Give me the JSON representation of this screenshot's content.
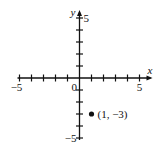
{
  "chart_data": {
    "type": "scatter",
    "title": "",
    "xlabel": "x",
    "ylabel": "y",
    "xlim": [
      -5,
      5
    ],
    "ylim": [
      -5,
      5
    ],
    "tick_step": 1,
    "grid": false,
    "x_tick_labels": [
      {
        "value": -5,
        "label": "-5"
      },
      {
        "value": 5,
        "label": "5"
      }
    ],
    "y_tick_labels": [
      {
        "value": 5,
        "label": "5"
      },
      {
        "value": -5,
        "label": "-5"
      }
    ],
    "origin_label": "0",
    "points": [
      {
        "x": 1,
        "y": -3,
        "label": "(1, −3)"
      }
    ]
  }
}
